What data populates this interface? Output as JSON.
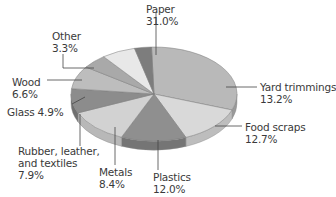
{
  "chart_data": {
    "type": "pie",
    "style": "3d-tilted",
    "title": "",
    "unit": "%",
    "categories": [
      "Paper",
      "Yard trimmings",
      "Food scraps",
      "Plastics",
      "Metals",
      "Rubber, leather, and textiles",
      "Glass",
      "Wood",
      "Other"
    ],
    "values": [
      31.0,
      13.2,
      12.7,
      12.0,
      8.4,
      7.9,
      4.9,
      6.6,
      3.3
    ],
    "slice_order_clockwise_from_top": [
      "Paper",
      "Yard trimmings",
      "Food scraps",
      "Plastics",
      "Metals",
      "Rubber, leather, and textiles",
      "Glass",
      "Wood",
      "Other"
    ],
    "legend": "none (leader-line labels)",
    "labels": [
      {
        "name": "Paper",
        "lines": [
          "Paper",
          "31.0%"
        ],
        "x": 146,
        "y": 3
      },
      {
        "name": "Yard trimmings",
        "lines": [
          "Yard trimmings",
          "13.2%"
        ],
        "x": 260,
        "y": 81
      },
      {
        "name": "Food scraps",
        "lines": [
          "Food scraps",
          "12.7%"
        ],
        "x": 245,
        "y": 121
      },
      {
        "name": "Plastics",
        "lines": [
          "Plastics",
          "12.0%"
        ],
        "x": 153,
        "y": 171
      },
      {
        "name": "Metals",
        "lines": [
          "Metals",
          "8.4%"
        ],
        "x": 99,
        "y": 166
      },
      {
        "name": "Rubber, leather, and textiles",
        "lines": [
          "Rubber, leather,",
          "and textiles",
          "7.9%"
        ],
        "x": 18,
        "y": 145
      },
      {
        "name": "Glass",
        "lines": [
          "Glass 4.9%"
        ],
        "x": 7,
        "y": 106
      },
      {
        "name": "Wood",
        "lines": [
          "Wood",
          "6.6%"
        ],
        "x": 12,
        "y": 76
      },
      {
        "name": "Other",
        "lines": [
          "Other",
          "3.3%"
        ],
        "x": 52,
        "y": 30
      }
    ],
    "colors": [
      "#b9b9b9",
      "#d9d9d9",
      "#8f8f8f",
      "#d2d2d2",
      "#8c8c8c",
      "#bdbdbd",
      "#a9a9a9",
      "#e8e8e8",
      "#7d7d7d"
    ],
    "side_colors": [
      "#9a9a9a",
      "#bdbdbd",
      "#757575",
      "#b8b8b8",
      "#6f6f6f",
      "#a0a0a0",
      "#8c8c8c",
      "#cfcfcf",
      "#5f5f5f"
    ]
  }
}
